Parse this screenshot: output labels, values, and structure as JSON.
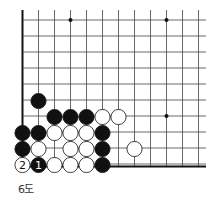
{
  "diagram": {
    "caption": "6도",
    "grid": {
      "origin_x": 22.5,
      "origin_y": 20,
      "spacing": 16,
      "cols": 12,
      "rows": 10,
      "right_extent": 206,
      "top_extent": 10,
      "left_edge_thick": true,
      "bottom_edge_thick": true,
      "line_color": "#444444",
      "edge_color": "#111111"
    },
    "star_points": [
      {
        "col": 3,
        "row": 0
      },
      {
        "col": 9,
        "row": 0
      },
      {
        "col": 9,
        "row": 6
      }
    ],
    "stones": [
      {
        "color": "black",
        "col": 1,
        "row": 5
      },
      {
        "color": "black",
        "col": 2,
        "row": 6
      },
      {
        "color": "black",
        "col": 3,
        "row": 6
      },
      {
        "color": "black",
        "col": 4,
        "row": 6
      },
      {
        "color": "white",
        "col": 5,
        "row": 6
      },
      {
        "color": "white",
        "col": 6,
        "row": 6
      },
      {
        "color": "black",
        "col": 0,
        "row": 7
      },
      {
        "color": "black",
        "col": 1,
        "row": 7
      },
      {
        "color": "white",
        "col": 2,
        "row": 7
      },
      {
        "color": "white",
        "col": 3,
        "row": 7
      },
      {
        "color": "white",
        "col": 4,
        "row": 7
      },
      {
        "color": "black",
        "col": 5,
        "row": 7
      },
      {
        "color": "black",
        "col": 0,
        "row": 8
      },
      {
        "color": "white",
        "col": 1,
        "row": 8
      },
      {
        "color": "white",
        "col": 3,
        "row": 8
      },
      {
        "color": "white",
        "col": 4,
        "row": 8
      },
      {
        "color": "black",
        "col": 5,
        "row": 8
      },
      {
        "color": "white",
        "col": 7,
        "row": 8
      },
      {
        "color": "white",
        "col": 0,
        "row": 9,
        "label": "2"
      },
      {
        "color": "black",
        "col": 1,
        "row": 9,
        "label": "1"
      },
      {
        "color": "white",
        "col": 2,
        "row": 9
      },
      {
        "color": "white",
        "col": 3,
        "row": 9
      },
      {
        "color": "white",
        "col": 4,
        "row": 9
      },
      {
        "color": "black",
        "col": 5,
        "row": 9
      }
    ]
  }
}
